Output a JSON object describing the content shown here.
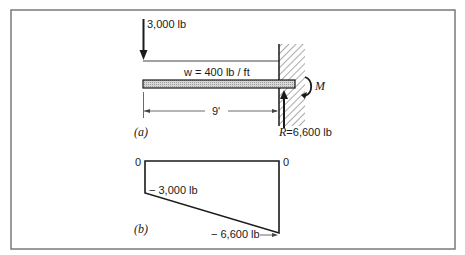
{
  "figure": {
    "part_a": {
      "label": "(a)",
      "point_load": "3,000 lb",
      "distributed_load": "w = 400 lb / ft",
      "span": "9'",
      "moment": "M",
      "reaction": "R=6,600 lb"
    },
    "part_b": {
      "label": "(b)",
      "left_zero": "0",
      "right_zero": "0",
      "left_value": "− 3,000 lb",
      "right_value": "− 6,600 lb"
    }
  },
  "colors": {
    "ink": "#1a1a1a",
    "frame": "#7a7a7a",
    "beam_fill": "#cfcfcf"
  }
}
